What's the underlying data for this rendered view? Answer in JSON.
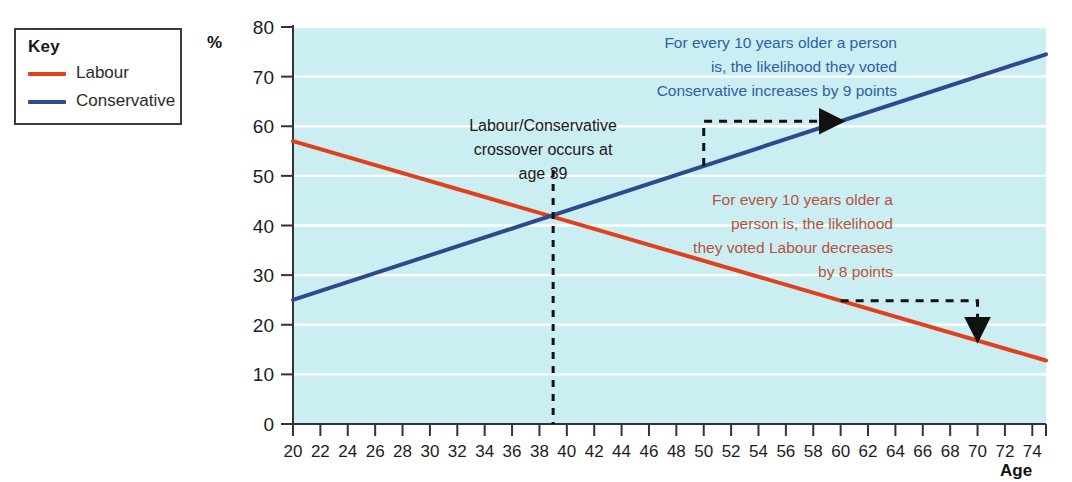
{
  "legend": {
    "title": "Key",
    "items": [
      {
        "label": "Labour",
        "color": "#e2401c"
      },
      {
        "label": "Conservative",
        "color": "#2e4a8c"
      }
    ]
  },
  "axes": {
    "y_axis_title": "%",
    "x_axis_title": "Age"
  },
  "annotations": {
    "conservative": {
      "lines": [
        "For every 10 years older a person",
        "is, the likelihood they voted",
        "Conservative increases by 9 points"
      ],
      "color": "#2f5fa6"
    },
    "labour": {
      "lines": [
        "For every 10 years older a",
        "person is, the likelihood",
        "they voted Labour decreases",
        "by 8 points"
      ],
      "color": "#b4543f"
    },
    "crossover": {
      "lines": [
        "Labour/Conservative",
        "crossover occurs at",
        "age 39"
      ],
      "color": "#1a1a1a"
    }
  },
  "chart_data": {
    "type": "line",
    "title": "",
    "xlabel": "Age",
    "ylabel": "%",
    "xlim": [
      20,
      75
    ],
    "ylim": [
      0,
      80
    ],
    "x_ticks": [
      20,
      22,
      24,
      26,
      28,
      30,
      32,
      34,
      36,
      38,
      40,
      42,
      44,
      46,
      48,
      50,
      52,
      54,
      56,
      58,
      60,
      62,
      64,
      66,
      68,
      70,
      72,
      74
    ],
    "y_ticks": [
      0,
      10,
      20,
      30,
      40,
      50,
      60,
      70,
      80
    ],
    "grid": "horizontal",
    "legend_position": "outside-left",
    "plot_background": "#cbeef2",
    "gridline_color": "#ffffff",
    "series": [
      {
        "name": "Labour",
        "color": "#e2401c",
        "slope_per_decade": -8,
        "x": [
          20,
          75
        ],
        "values": [
          57.0,
          12.8
        ]
      },
      {
        "name": "Conservative",
        "color": "#2e4a8c",
        "slope_per_decade": 9,
        "x": [
          20,
          75
        ],
        "values": [
          25.0,
          74.5
        ]
      }
    ],
    "markers": [
      {
        "name": "crossover",
        "x": 39,
        "y": 41.5,
        "style": "dashed-vertical-line",
        "label": "age 39"
      },
      {
        "name": "conservative-slope-arrow",
        "from_x": 50,
        "from_y": 51.0,
        "to_x": 60,
        "to_y": 60.0,
        "style": "dashed-elbow-arrow"
      },
      {
        "name": "labour-slope-arrow",
        "from_x": 60,
        "from_y": 24.9,
        "to_x": 70,
        "to_y": 17.0,
        "style": "dashed-elbow-arrow"
      }
    ]
  }
}
